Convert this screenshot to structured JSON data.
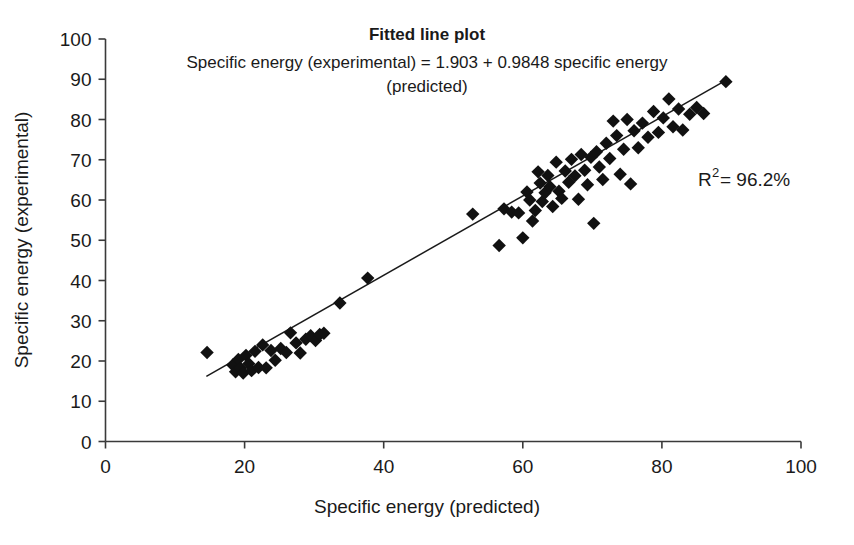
{
  "chart_data": {
    "type": "scatter",
    "title": "Fitted line plot",
    "subtitle_line1": "Specific energy (experimental) = 1.903 + 0.9848 specific energy",
    "subtitle_line2": "(predicted)",
    "xlabel": "Specific energy (predicted)",
    "ylabel": "Specific energy (experimental)",
    "xlim": [
      0,
      100
    ],
    "ylim": [
      0,
      100
    ],
    "xticks": [
      0,
      20,
      40,
      60,
      80,
      100
    ],
    "yticks": [
      0,
      10,
      20,
      30,
      40,
      50,
      60,
      70,
      80,
      90,
      100
    ],
    "grid": false,
    "legend": "none",
    "annotation": {
      "r_symbol": "R",
      "r_exponent": "2",
      "r_equals": " = 96.2%",
      "full_text": "R2 = 96.2%",
      "r_squared_value": 96.2,
      "units": "%"
    },
    "fit": {
      "intercept": 1.903,
      "slope": 0.9848,
      "x_start": 14.5,
      "x_end": 89.5,
      "label": "regression-line"
    },
    "marker": {
      "shape": "diamond",
      "color": "#111111",
      "size": 9
    },
    "series": [
      {
        "name": "Specific energy",
        "points": [
          [
            14.6,
            22.1
          ],
          [
            18.3,
            19.0
          ],
          [
            18.7,
            17.3
          ],
          [
            19.1,
            20.4
          ],
          [
            19.4,
            18.2
          ],
          [
            19.8,
            17.0
          ],
          [
            20.2,
            21.4
          ],
          [
            20.6,
            19.3
          ],
          [
            21.0,
            17.6
          ],
          [
            21.5,
            22.4
          ],
          [
            22.0,
            18.4
          ],
          [
            22.6,
            24.0
          ],
          [
            23.1,
            18.3
          ],
          [
            23.8,
            22.6
          ],
          [
            24.4,
            20.2
          ],
          [
            25.2,
            23.1
          ],
          [
            26.0,
            22.1
          ],
          [
            26.6,
            27.0
          ],
          [
            27.4,
            24.5
          ],
          [
            28.0,
            22.0
          ],
          [
            28.8,
            25.4
          ],
          [
            29.5,
            26.3
          ],
          [
            30.2,
            25.1
          ],
          [
            30.8,
            26.6
          ],
          [
            31.4,
            26.9
          ],
          [
            33.7,
            34.4
          ],
          [
            37.7,
            40.6
          ],
          [
            52.8,
            56.5
          ],
          [
            56.6,
            48.7
          ],
          [
            57.3,
            57.8
          ],
          [
            58.4,
            57.0
          ],
          [
            59.4,
            56.8
          ],
          [
            60.0,
            50.6
          ],
          [
            60.6,
            62.0
          ],
          [
            61.0,
            60.0
          ],
          [
            61.4,
            54.8
          ],
          [
            61.8,
            57.4
          ],
          [
            62.2,
            67.0
          ],
          [
            62.5,
            64.2
          ],
          [
            62.8,
            59.6
          ],
          [
            63.2,
            61.8
          ],
          [
            63.6,
            66.1
          ],
          [
            63.9,
            63.3
          ],
          [
            64.3,
            58.4
          ],
          [
            64.8,
            69.4
          ],
          [
            65.2,
            62.2
          ],
          [
            65.6,
            60.4
          ],
          [
            66.1,
            67.2
          ],
          [
            66.6,
            64.4
          ],
          [
            67.0,
            70.1
          ],
          [
            67.5,
            66.0
          ],
          [
            68.0,
            60.2
          ],
          [
            68.4,
            71.3
          ],
          [
            68.9,
            67.4
          ],
          [
            69.3,
            63.8
          ],
          [
            69.8,
            70.6
          ],
          [
            70.2,
            54.2
          ],
          [
            70.6,
            72.0
          ],
          [
            71.0,
            68.2
          ],
          [
            71.5,
            65.1
          ],
          [
            72.0,
            74.1
          ],
          [
            72.5,
            70.3
          ],
          [
            73.0,
            79.6
          ],
          [
            73.5,
            76.0
          ],
          [
            74.0,
            66.4
          ],
          [
            74.5,
            72.6
          ],
          [
            75.0,
            80.0
          ],
          [
            75.5,
            64.0
          ],
          [
            76.0,
            77.2
          ],
          [
            76.6,
            73.0
          ],
          [
            77.2,
            79.1
          ],
          [
            78.0,
            75.6
          ],
          [
            78.8,
            82.0
          ],
          [
            79.5,
            76.8
          ],
          [
            80.2,
            80.4
          ],
          [
            81.0,
            85.1
          ],
          [
            81.6,
            78.2
          ],
          [
            82.4,
            82.6
          ],
          [
            83.0,
            77.4
          ],
          [
            84.0,
            81.3
          ],
          [
            85.0,
            83.0
          ],
          [
            86.0,
            81.5
          ],
          [
            89.2,
            89.4
          ]
        ]
      }
    ]
  },
  "axes": {
    "x_tick_labels": [
      "0",
      "20",
      "40",
      "60",
      "80",
      "100"
    ],
    "y_tick_labels": [
      "0",
      "10",
      "20",
      "30",
      "40",
      "50",
      "60",
      "70",
      "80",
      "90",
      "100"
    ]
  }
}
